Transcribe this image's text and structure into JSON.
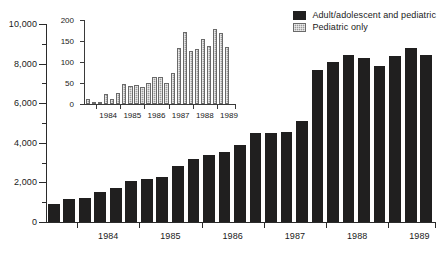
{
  "chart_data": {
    "type": "bar",
    "title": "",
    "xlabel": "",
    "ylabel": "",
    "ylim": [
      0,
      10000
    ],
    "grid": false,
    "legend_position": "top-right",
    "legend": [
      {
        "label": "Adult/adolescent and pediatric",
        "color": "#201f1f",
        "swatch": "solid-dark"
      },
      {
        "label": "Pediatric only",
        "color": "#9a9a9a",
        "swatch": "hatched-light"
      }
    ],
    "y_major_ticks": [
      "0",
      "2,000",
      "4,000",
      "6,000",
      "8,000",
      "10,000"
    ],
    "y_major_values": [
      0,
      2000,
      4000,
      6000,
      8000,
      10000
    ],
    "y_minor_values": [
      1000,
      3000,
      5000,
      7000,
      9000
    ],
    "x_year_labels": [
      "1984",
      "1985",
      "1986",
      "1987",
      "1988",
      "1989"
    ],
    "categories": [
      "1983-Q3",
      "1983-Q4",
      "1984-Q1",
      "1984-Q2",
      "1984-Q3",
      "1984-Q4",
      "1985-Q1",
      "1985-Q2",
      "1985-Q3",
      "1985-Q4",
      "1986-Q1",
      "1986-Q2",
      "1986-Q3",
      "1986-Q4",
      "1987-Q1",
      "1987-Q2",
      "1987-Q3",
      "1987-Q4",
      "1988-Q1",
      "1988-Q2",
      "1988-Q3",
      "1988-Q4",
      "1989-Q1",
      "1989-Q2",
      "1989-Q3"
    ],
    "series": [
      {
        "name": "Adult/adolescent and pediatric",
        "color": "#201f1f",
        "values": [
          900,
          1150,
          1200,
          1500,
          1700,
          2050,
          2150,
          2250,
          2850,
          3200,
          3400,
          3550,
          3900,
          4500,
          4500,
          4550,
          5100,
          7700,
          8100,
          8450,
          8300,
          7900,
          8400,
          8800,
          8450
        ]
      }
    ],
    "inset": {
      "type": "bar",
      "ylim": [
        0,
        200
      ],
      "y_major_ticks": [
        "0",
        "50",
        "100",
        "150",
        "200"
      ],
      "y_major_values": [
        0,
        50,
        100,
        150,
        200
      ],
      "x_year_labels": [
        "1984",
        "1985",
        "1986",
        "1987",
        "1988",
        "1989"
      ],
      "categories": [
        "1983-Q3",
        "1983-Q4",
        "1984-Q1",
        "1984-Q2",
        "1984-Q3",
        "1984-Q4",
        "1985-Q1",
        "1985-Q2",
        "1985-Q3",
        "1985-Q4",
        "1986-Q1",
        "1986-Q2",
        "1986-Q3",
        "1986-Q4",
        "1987-Q1",
        "1987-Q2",
        "1987-Q3",
        "1987-Q4",
        "1988-Q1",
        "1988-Q2",
        "1988-Q3",
        "1988-Q4",
        "1989-Q1",
        "1989-Q2",
        "1989-Q3"
      ],
      "series": [
        {
          "name": "Pediatric only",
          "color": "#9a9a9a",
          "values": [
            12,
            3,
            5,
            23,
            13,
            26,
            47,
            42,
            46,
            40,
            49,
            64,
            64,
            51,
            74,
            133,
            171,
            127,
            131,
            155,
            138,
            179,
            168,
            136,
            0
          ]
        }
      ]
    }
  }
}
